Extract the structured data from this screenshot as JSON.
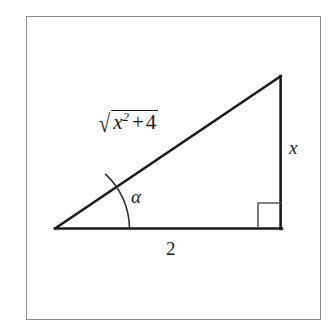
{
  "figure": {
    "background_color": "#ffffff",
    "stroke_color": "#1a1a1a",
    "frame_color": "#8a8a8a",
    "labels": {
      "hypotenuse": {
        "radical_sign": "√",
        "radicand_base": "x",
        "radicand_exponent": "2",
        "radicand_operator": "+",
        "radicand_term": "4",
        "plain_text": "√(x² + 4)"
      },
      "vertical_leg": "x",
      "base_leg": "2",
      "angle": "α"
    },
    "geometry": {
      "left_vertex": "(55, 229)",
      "apex_vertex": "(281, 76)",
      "right_vertex": "(281, 229)",
      "base_length_label": "2",
      "height_label": "x",
      "hypotenuse_label": "√(x² + 4)",
      "right_angle_marker": "square",
      "angle_marker": "arc"
    }
  }
}
